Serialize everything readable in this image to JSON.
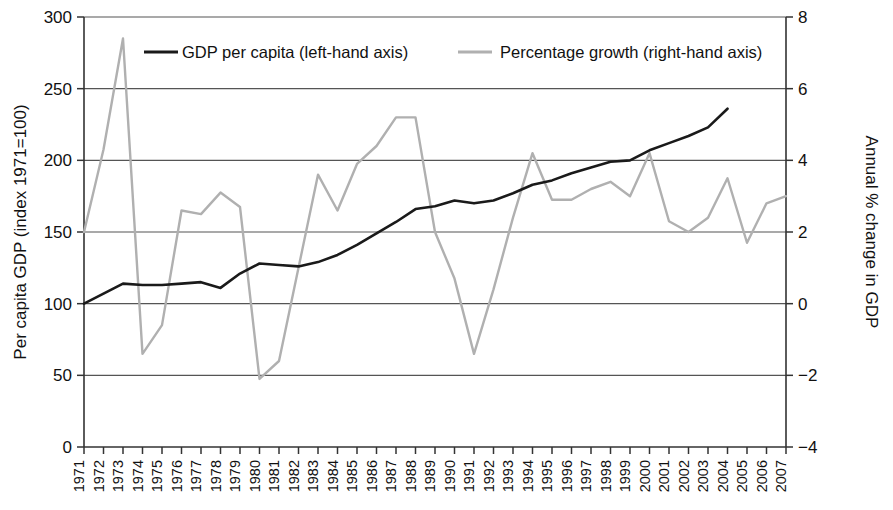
{
  "chart_data": {
    "type": "line",
    "title": "",
    "xlabel": "",
    "ylabel": "Per capita GDP (index 1971=100)",
    "y2label": "Annual % change in GDP",
    "grid": true,
    "legend_position": "top-inside",
    "ylim": [
      0,
      300
    ],
    "y2lim": [
      -4,
      8
    ],
    "yticks": [
      "0",
      "50",
      "100",
      "150",
      "200",
      "250",
      "300"
    ],
    "ytick_values": [
      0,
      50,
      100,
      150,
      200,
      250,
      300
    ],
    "y2ticks": [
      "−4",
      "−2",
      "0",
      "2",
      "4",
      "6",
      "8"
    ],
    "y2tick_values": [
      -4,
      -2,
      0,
      2,
      4,
      6,
      8
    ],
    "categories": [
      "1971",
      "1972",
      "1973",
      "1974",
      "1975",
      "1976",
      "1977",
      "1978",
      "1979",
      "1980",
      "1981",
      "1982",
      "1983",
      "1984",
      "1985",
      "1986",
      "1987",
      "1988",
      "1989",
      "1990",
      "1991",
      "1992",
      "1993",
      "1994",
      "1995",
      "1996",
      "1997",
      "1998",
      "1999",
      "2000",
      "2001",
      "2002",
      "2003",
      "2004",
      "2005",
      "2006",
      "2007"
    ],
    "series": [
      {
        "name": "GDP per capita (left-hand axis)",
        "axis": "left",
        "color": "#1a1a1a",
        "values": [
          100,
          107,
          114,
          113,
          113,
          114,
          115,
          111,
          121,
          128,
          127,
          126,
          129,
          134,
          141,
          149,
          157,
          166,
          168,
          172,
          170,
          172,
          177,
          183,
          186,
          191,
          195,
          199,
          200,
          207,
          212,
          217,
          223,
          236,
          null,
          null,
          null
        ]
      },
      {
        "name": "Percentage growth (right-hand axis)",
        "axis": "right",
        "color": "#b0b0b0",
        "values": [
          2.0,
          4.3,
          7.4,
          -1.4,
          -0.6,
          2.6,
          2.5,
          3.1,
          2.7,
          -2.1,
          -1.6,
          1.0,
          3.6,
          2.6,
          3.9,
          4.4,
          5.2,
          5.2,
          2.0,
          0.7,
          -1.4,
          0.4,
          2.4,
          4.2,
          2.9,
          2.9,
          3.2,
          3.4,
          3.0,
          4.2,
          2.3,
          2.0,
          2.4,
          3.5,
          1.7,
          2.8,
          3.0
        ]
      }
    ],
    "legend": [
      {
        "label": "GDP per capita (left-hand axis)",
        "color": "#1a1a1a"
      },
      {
        "label": "Percentage growth (right-hand axis)",
        "color": "#b0b0b0"
      }
    ]
  },
  "colors": {
    "gdp_line": "#1a1a1a",
    "growth_line": "#b0b0b0",
    "grid": "#555555",
    "axis": "#333333",
    "background": "#ffffff"
  }
}
